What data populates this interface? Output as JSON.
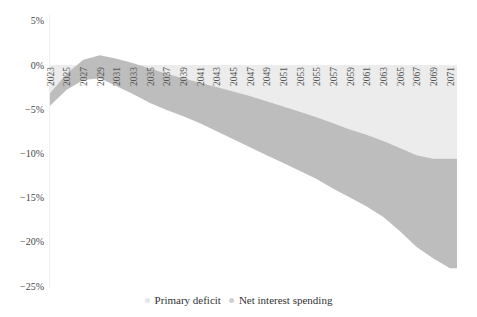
{
  "chart_data": {
    "type": "area",
    "title": "",
    "xlabel": "",
    "ylabel": "",
    "ylim": [
      -25,
      5
    ],
    "y_ticks": [
      "5%",
      "0%",
      "−5%",
      "−10%",
      "−15%",
      "−20%",
      "−25%"
    ],
    "y_tick_values": [
      5,
      0,
      -5,
      -10,
      -15,
      -20,
      -25
    ],
    "x_ticks": [
      "2023",
      "2025",
      "2027",
      "2029",
      "2031",
      "2033",
      "2035",
      "2037",
      "2039",
      "2041",
      "2043",
      "2045",
      "2047",
      "2049",
      "2051",
      "2053",
      "2055",
      "2057",
      "2059",
      "2061",
      "2063",
      "2065",
      "2067",
      "2069",
      "2071"
    ],
    "x": [
      2023,
      2025,
      2027,
      2029,
      2031,
      2033,
      2035,
      2037,
      2039,
      2041,
      2043,
      2045,
      2047,
      2049,
      2051,
      2053,
      2055,
      2057,
      2059,
      2061,
      2063,
      2065,
      2067,
      2069,
      2071
    ],
    "series": [
      {
        "name": "Primary deficit",
        "color": "#ececec",
        "values": [
          -3.2,
          -1.0,
          0.6,
          1.1,
          0.7,
          0.2,
          -0.4,
          -1.0,
          -1.5,
          -2.0,
          -2.5,
          -3.0,
          -3.5,
          -4.1,
          -4.7,
          -5.3,
          -5.9,
          -6.6,
          -7.3,
          -7.9,
          -8.6,
          -9.4,
          -10.2,
          -10.6,
          -10.6
        ]
      },
      {
        "name": "Net interest spending",
        "color": "#bdbdbd",
        "values": [
          -1.4,
          -1.8,
          -2.3,
          -2.6,
          -3.1,
          -3.5,
          -3.9,
          -4.1,
          -4.3,
          -4.6,
          -5.0,
          -5.4,
          -5.8,
          -6.1,
          -6.4,
          -6.7,
          -7.0,
          -7.4,
          -7.7,
          -8.1,
          -8.6,
          -9.4,
          -10.4,
          -11.3,
          -12.4
        ]
      }
    ],
    "stacked": true,
    "grid": false,
    "legend_position": "bottom"
  },
  "legend": {
    "items": [
      {
        "label": "Primary deficit",
        "color": "#e6e6e6"
      },
      {
        "label": "Net interest spending",
        "color": "#cfcfcf"
      }
    ]
  }
}
